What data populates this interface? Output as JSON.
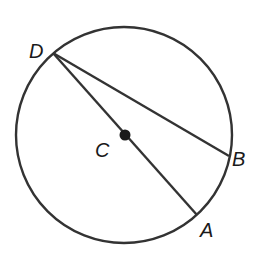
{
  "diagram": {
    "circle": {
      "cx": 124,
      "cy": 135,
      "r": 108,
      "stroke": "#333333"
    },
    "center_point": {
      "label": "C",
      "x": 125,
      "y": 135
    },
    "points": [
      {
        "label": "D",
        "x": 53,
        "y": 53
      },
      {
        "label": "B",
        "x": 229,
        "y": 156
      },
      {
        "label": "A",
        "x": 197,
        "y": 215
      }
    ],
    "segments": [
      {
        "from": "D",
        "to": "A",
        "note": "diameter through C"
      },
      {
        "from": "D",
        "to": "B",
        "note": "chord"
      }
    ],
    "labels": {
      "D": "D",
      "C": "C",
      "B": "B",
      "A": "A"
    }
  }
}
